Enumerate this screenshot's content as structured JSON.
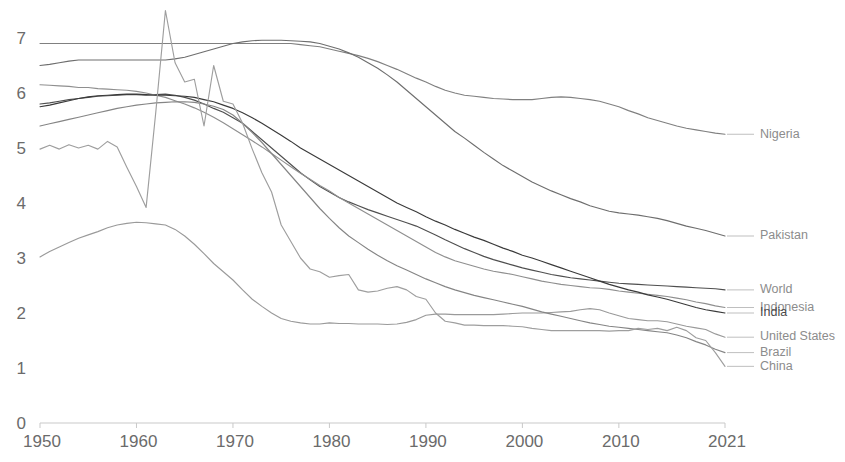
{
  "chart_data": {
    "type": "line",
    "title": "",
    "subtitle": "",
    "xlabel": "",
    "ylabel": "",
    "xlim": [
      1950,
      2021
    ],
    "ylim": [
      0,
      7.35
    ],
    "grid": false,
    "legend_position": "right-inline-labels",
    "x_ticks": [
      "1950",
      "1960",
      "1970",
      "1980",
      "1990",
      "2000",
      "2010",
      "2021"
    ],
    "x_tick_values": [
      1950,
      1960,
      1970,
      1980,
      1990,
      2000,
      2010,
      2021
    ],
    "y_ticks": [
      "0",
      "1",
      "2",
      "3",
      "4",
      "5",
      "6",
      "7"
    ],
    "y_tick_values": [
      0,
      1,
      2,
      3,
      4,
      5,
      6,
      7
    ],
    "x": [
      1950,
      1951,
      1952,
      1953,
      1954,
      1955,
      1956,
      1957,
      1958,
      1959,
      1960,
      1961,
      1962,
      1963,
      1964,
      1965,
      1966,
      1967,
      1968,
      1969,
      1970,
      1971,
      1972,
      1973,
      1974,
      1975,
      1976,
      1977,
      1978,
      1979,
      1980,
      1981,
      1982,
      1983,
      1984,
      1985,
      1986,
      1987,
      1988,
      1989,
      1990,
      1991,
      1992,
      1993,
      1994,
      1995,
      1996,
      1997,
      1998,
      1999,
      2000,
      2001,
      2002,
      2003,
      2004,
      2005,
      2006,
      2007,
      2008,
      2009,
      2010,
      2011,
      2012,
      2013,
      2014,
      2015,
      2016,
      2017,
      2018,
      2019,
      2020,
      2021
    ],
    "series": [
      {
        "name": "Nigeria",
        "color": "#808080",
        "label_y_value": 5.25,
        "values": [
          6.9,
          6.9,
          6.9,
          6.9,
          6.9,
          6.9,
          6.9,
          6.9,
          6.9,
          6.9,
          6.9,
          6.9,
          6.9,
          6.9,
          6.9,
          6.9,
          6.9,
          6.9,
          6.9,
          6.9,
          6.9,
          6.9,
          6.9,
          6.9,
          6.9,
          6.9,
          6.9,
          6.88,
          6.86,
          6.84,
          6.8,
          6.76,
          6.72,
          6.68,
          6.63,
          6.57,
          6.5,
          6.43,
          6.35,
          6.27,
          6.2,
          6.12,
          6.05,
          6.0,
          5.96,
          5.94,
          5.92,
          5.9,
          5.89,
          5.88,
          5.88,
          5.88,
          5.9,
          5.92,
          5.93,
          5.92,
          5.9,
          5.88,
          5.85,
          5.8,
          5.75,
          5.68,
          5.62,
          5.55,
          5.5,
          5.45,
          5.4,
          5.36,
          5.33,
          5.3,
          5.27,
          5.25
        ]
      },
      {
        "name": "Pakistan",
        "color": "#6e6e6e",
        "label_y_value": 3.4,
        "values": [
          6.5,
          6.52,
          6.55,
          6.58,
          6.6,
          6.6,
          6.6,
          6.6,
          6.6,
          6.6,
          6.6,
          6.6,
          6.6,
          6.6,
          6.62,
          6.65,
          6.7,
          6.75,
          6.8,
          6.85,
          6.9,
          6.93,
          6.95,
          6.96,
          6.96,
          6.96,
          6.95,
          6.94,
          6.93,
          6.9,
          6.85,
          6.8,
          6.73,
          6.65,
          6.55,
          6.45,
          6.33,
          6.2,
          6.05,
          5.9,
          5.75,
          5.6,
          5.45,
          5.3,
          5.18,
          5.05,
          4.92,
          4.8,
          4.68,
          4.58,
          4.48,
          4.38,
          4.3,
          4.22,
          4.15,
          4.08,
          4.02,
          3.95,
          3.9,
          3.85,
          3.82,
          3.8,
          3.78,
          3.75,
          3.72,
          3.68,
          3.63,
          3.58,
          3.54,
          3.5,
          3.45,
          3.4
        ]
      },
      {
        "name": "World",
        "color": "#4f4f4f",
        "label_y_value": 2.42,
        "values": [
          5.8,
          5.82,
          5.85,
          5.88,
          5.9,
          5.92,
          5.94,
          5.95,
          5.96,
          5.97,
          5.97,
          5.96,
          5.97,
          5.98,
          5.96,
          5.92,
          5.87,
          5.8,
          5.72,
          5.65,
          5.55,
          5.45,
          5.3,
          5.15,
          5.0,
          4.85,
          4.7,
          4.55,
          4.42,
          4.3,
          4.2,
          4.1,
          4.02,
          3.95,
          3.88,
          3.82,
          3.76,
          3.7,
          3.64,
          3.58,
          3.5,
          3.42,
          3.33,
          3.25,
          3.17,
          3.1,
          3.03,
          2.97,
          2.92,
          2.87,
          2.82,
          2.78,
          2.74,
          2.7,
          2.67,
          2.64,
          2.62,
          2.6,
          2.58,
          2.56,
          2.54,
          2.53,
          2.52,
          2.51,
          2.5,
          2.49,
          2.48,
          2.47,
          2.46,
          2.45,
          2.44,
          2.42
        ]
      },
      {
        "name": "Indonesia",
        "color": "#8f8f8f",
        "label_y_value": 2.1,
        "values": [
          6.15,
          6.14,
          6.13,
          6.12,
          6.1,
          6.1,
          6.08,
          6.07,
          6.06,
          6.05,
          6.03,
          6.0,
          5.96,
          5.92,
          5.86,
          5.8,
          5.73,
          5.65,
          5.56,
          5.46,
          5.35,
          5.24,
          5.13,
          5.02,
          4.9,
          4.78,
          4.66,
          4.54,
          4.43,
          4.32,
          4.22,
          4.1,
          4.0,
          3.9,
          3.8,
          3.7,
          3.6,
          3.5,
          3.4,
          3.3,
          3.2,
          3.1,
          3.02,
          2.95,
          2.9,
          2.85,
          2.8,
          2.76,
          2.73,
          2.7,
          2.66,
          2.62,
          2.58,
          2.55,
          2.52,
          2.5,
          2.48,
          2.46,
          2.45,
          2.43,
          2.4,
          2.38,
          2.36,
          2.34,
          2.32,
          2.3,
          2.27,
          2.24,
          2.2,
          2.17,
          2.13,
          2.1
        ]
      },
      {
        "name": "India",
        "color": "#3a3a3a",
        "label_y_value": 2.0,
        "values": [
          5.75,
          5.78,
          5.82,
          5.86,
          5.9,
          5.93,
          5.95,
          5.96,
          5.97,
          5.98,
          5.98,
          5.97,
          5.96,
          5.96,
          5.95,
          5.94,
          5.92,
          5.88,
          5.84,
          5.78,
          5.72,
          5.64,
          5.55,
          5.45,
          5.34,
          5.23,
          5.12,
          5.0,
          4.9,
          4.8,
          4.7,
          4.6,
          4.5,
          4.4,
          4.3,
          4.2,
          4.1,
          4.0,
          3.92,
          3.84,
          3.75,
          3.67,
          3.6,
          3.52,
          3.45,
          3.38,
          3.32,
          3.25,
          3.18,
          3.12,
          3.05,
          3.0,
          2.94,
          2.88,
          2.82,
          2.76,
          2.7,
          2.64,
          2.58,
          2.52,
          2.47,
          2.42,
          2.38,
          2.33,
          2.29,
          2.25,
          2.2,
          2.15,
          2.1,
          2.06,
          2.03,
          2.0
        ]
      },
      {
        "name": "United States",
        "color": "#9a9a9a",
        "label_y_value": 1.56,
        "values": [
          3.02,
          3.12,
          3.2,
          3.28,
          3.36,
          3.42,
          3.48,
          3.55,
          3.6,
          3.63,
          3.65,
          3.64,
          3.62,
          3.6,
          3.52,
          3.4,
          3.25,
          3.08,
          2.9,
          2.75,
          2.6,
          2.42,
          2.25,
          2.12,
          2.0,
          1.9,
          1.85,
          1.82,
          1.8,
          1.8,
          1.82,
          1.81,
          1.81,
          1.8,
          1.8,
          1.8,
          1.79,
          1.8,
          1.83,
          1.88,
          1.96,
          1.98,
          1.98,
          1.97,
          1.97,
          1.97,
          1.97,
          1.97,
          1.98,
          1.99,
          2.0,
          2.0,
          2.0,
          2.01,
          2.02,
          2.03,
          2.06,
          2.08,
          2.06,
          2.0,
          1.95,
          1.9,
          1.88,
          1.86,
          1.86,
          1.84,
          1.8,
          1.76,
          1.73,
          1.7,
          1.62,
          1.56
        ]
      },
      {
        "name": "Brazil",
        "color": "#858585",
        "label_y_value": 1.28,
        "values": [
          5.4,
          5.44,
          5.48,
          5.52,
          5.56,
          5.6,
          5.64,
          5.68,
          5.72,
          5.75,
          5.78,
          5.8,
          5.82,
          5.83,
          5.84,
          5.84,
          5.83,
          5.8,
          5.76,
          5.7,
          5.6,
          5.45,
          5.28,
          5.1,
          4.9,
          4.7,
          4.5,
          4.3,
          4.1,
          3.9,
          3.72,
          3.55,
          3.4,
          3.28,
          3.16,
          3.05,
          2.95,
          2.86,
          2.78,
          2.7,
          2.62,
          2.55,
          2.48,
          2.42,
          2.37,
          2.32,
          2.28,
          2.24,
          2.2,
          2.16,
          2.12,
          2.07,
          2.02,
          1.98,
          1.94,
          1.9,
          1.86,
          1.82,
          1.79,
          1.76,
          1.74,
          1.72,
          1.7,
          1.68,
          1.66,
          1.64,
          1.6,
          1.55,
          1.48,
          1.42,
          1.34,
          1.28
        ]
      },
      {
        "name": "China",
        "color": "#9e9e9e",
        "label_y_value": 1.03,
        "values": [
          4.98,
          5.05,
          4.98,
          5.06,
          5.0,
          5.05,
          4.98,
          5.12,
          5.02,
          4.65,
          4.3,
          3.92,
          5.65,
          7.5,
          6.55,
          6.2,
          6.25,
          5.4,
          6.5,
          5.85,
          5.8,
          5.45,
          4.98,
          4.55,
          4.2,
          3.6,
          3.3,
          3.0,
          2.8,
          2.75,
          2.65,
          2.68,
          2.7,
          2.42,
          2.38,
          2.4,
          2.45,
          2.48,
          2.42,
          2.3,
          2.25,
          2.0,
          1.85,
          1.82,
          1.78,
          1.78,
          1.77,
          1.77,
          1.77,
          1.76,
          1.75,
          1.72,
          1.7,
          1.68,
          1.68,
          1.68,
          1.68,
          1.68,
          1.68,
          1.67,
          1.68,
          1.68,
          1.72,
          1.7,
          1.72,
          1.68,
          1.74,
          1.68,
          1.55,
          1.5,
          1.28,
          1.03
        ]
      }
    ]
  }
}
